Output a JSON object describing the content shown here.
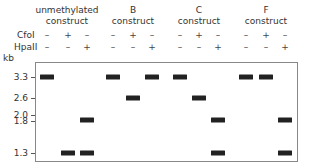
{
  "groups": [
    {
      "title_line1": "unmethylated",
      "title_line2": "construct",
      "x": 67
    },
    {
      "title_line1": "B",
      "title_line2": "construct",
      "x": 133
    },
    {
      "title_line1": "C",
      "title_line2": "construct",
      "x": 199
    },
    {
      "title_line1": "F",
      "title_line2": "construct",
      "x": 266
    }
  ],
  "rows": {
    "cfoi_label": "CfoI",
    "hpaii_label": "HpaII"
  },
  "lanes": [
    {
      "x": 47,
      "cfoi": "–",
      "hpaii": "–",
      "bands": [
        3.3
      ]
    },
    {
      "x": 68,
      "cfoi": "+",
      "hpaii": "–",
      "bands": [
        1.3
      ]
    },
    {
      "x": 87,
      "cfoi": "–",
      "hpaii": "+",
      "bands": [
        1.8,
        1.3
      ]
    },
    {
      "x": 113,
      "cfoi": "–",
      "hpaii": "–",
      "bands": [
        3.3
      ]
    },
    {
      "x": 133,
      "cfoi": "+",
      "hpaii": "–",
      "bands": [
        2.6
      ]
    },
    {
      "x": 152,
      "cfoi": "–",
      "hpaii": "+",
      "bands": [
        3.3
      ]
    },
    {
      "x": 180,
      "cfoi": "–",
      "hpaii": "–",
      "bands": [
        3.3
      ]
    },
    {
      "x": 199,
      "cfoi": "+",
      "hpaii": "–",
      "bands": [
        2.6
      ]
    },
    {
      "x": 218,
      "cfoi": "–",
      "hpaii": "+",
      "bands": [
        1.8,
        1.3
      ]
    },
    {
      "x": 246,
      "cfoi": "–",
      "hpaii": "–",
      "bands": [
        3.3
      ]
    },
    {
      "x": 266,
      "cfoi": "+",
      "hpaii": "–",
      "bands": [
        3.3
      ]
    },
    {
      "x": 285,
      "cfoi": "–",
      "hpaii": "+",
      "bands": [
        1.8,
        1.3
      ]
    }
  ],
  "axis": {
    "unit_label": "kb",
    "markers": [
      {
        "label": "3.3",
        "y": 77
      },
      {
        "label": "2.6",
        "y": 98
      },
      {
        "label": "2.0",
        "y": 115
      },
      {
        "label": "1.8",
        "y": 121
      },
      {
        "label": "1.3",
        "y": 153
      }
    ]
  },
  "band_y": {
    "3.3": 77,
    "2.6": 98,
    "1.8": 120,
    "1.3": 153
  }
}
